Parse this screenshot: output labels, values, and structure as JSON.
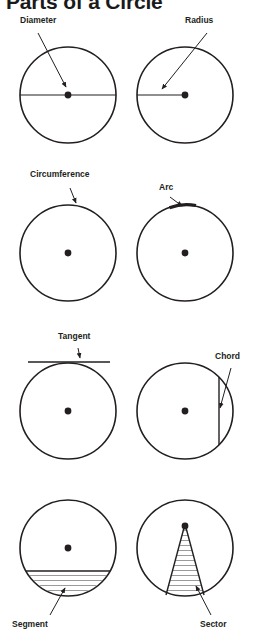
{
  "title": "Parts of a Circle",
  "colors": {
    "stroke": "#231f20",
    "text": "#231f20",
    "background": "#ffffff",
    "fill": "#ffffff"
  },
  "figures": [
    {
      "id": "diameter",
      "label": "Diameter",
      "label_x": 20,
      "label_y": 22,
      "circle": {
        "cx": 68,
        "cy": 95,
        "r": 48
      },
      "center_dot": true,
      "arrow_from": {
        "x": 38,
        "y": 33
      },
      "arrow_to": {
        "x": 66,
        "y": 88
      }
    },
    {
      "id": "radius",
      "label": "Radius",
      "label_x": 185,
      "label_y": 22,
      "circle": {
        "cx": 185,
        "cy": 95,
        "r": 48
      },
      "center_dot": true,
      "arrow_from": {
        "x": 205,
        "y": 33
      },
      "arrow_to": {
        "x": 160,
        "y": 90
      }
    },
    {
      "id": "circumference",
      "label": "Circumference",
      "label_x": 30,
      "label_y": 175,
      "circle": {
        "cx": 68,
        "cy": 253,
        "r": 48
      },
      "center_dot": true,
      "arrow_from": {
        "x": 70,
        "y": 188
      },
      "arrow_to": {
        "x": 76,
        "y": 206
      }
    },
    {
      "id": "arc",
      "label": "Arc",
      "label_x": 160,
      "label_y": 188,
      "circle": {
        "cx": 185,
        "cy": 253,
        "r": 48
      },
      "center_dot": true,
      "arrow_from": {
        "x": 170,
        "y": 198
      },
      "arrow_to": {
        "x": 184,
        "y": 208
      }
    },
    {
      "id": "tangent",
      "label": "Tangent",
      "label_x": 60,
      "label_y": 337,
      "circle": {
        "cx": 68,
        "cy": 411,
        "r": 48
      },
      "center_dot": true,
      "arrow_from": {
        "x": 78,
        "y": 348
      },
      "arrow_to": {
        "x": 80,
        "y": 360
      }
    },
    {
      "id": "chord",
      "label": "Chord",
      "label_x": 215,
      "label_y": 357,
      "circle": {
        "cx": 185,
        "cy": 411,
        "r": 48
      },
      "center_dot": true,
      "arrow_from": {
        "x": 230,
        "y": 368
      },
      "arrow_to": {
        "x": 219,
        "y": 410
      }
    },
    {
      "id": "segment",
      "label": "Segment",
      "label_x": 12,
      "label_y": 625,
      "circle": {
        "cx": 68,
        "cy": 548,
        "r": 48
      },
      "center_dot": true,
      "hatched": true,
      "arrow_from": {
        "x": 50,
        "y": 616
      },
      "arrow_to": {
        "x": 66,
        "y": 586
      }
    },
    {
      "id": "sector",
      "label": "Sector",
      "label_x": 200,
      "label_y": 625,
      "circle": {
        "cx": 185,
        "cy": 548,
        "r": 48
      },
      "center_dot": true,
      "hatched": true,
      "arrow_from": {
        "x": 210,
        "y": 616
      },
      "arrow_to": {
        "x": 194,
        "y": 583
      }
    }
  ]
}
